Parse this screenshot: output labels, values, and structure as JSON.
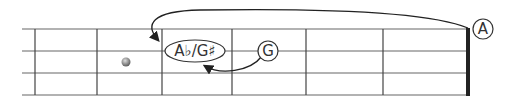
{
  "diagram": {
    "type": "guitar-fretboard",
    "strings": 4,
    "frets": [
      "fret-1",
      "fret-2",
      "fret-3",
      "fret-4",
      "fret-5",
      "fret-6"
    ],
    "inlay_marker": {
      "fret_space": 2,
      "string": "between 2 and 3"
    },
    "notes": {
      "target": "A♭/G♯",
      "g_note": "G",
      "open_a": "A"
    },
    "arrows": [
      {
        "from": "A",
        "to": "A♭/G♯",
        "direction": "curved over fretboard"
      },
      {
        "from": "G",
        "to": "A♭/G♯",
        "direction": "curved under"
      }
    ],
    "colors": {
      "line": "#555555",
      "nut": "#222222",
      "marker": "#888888"
    }
  }
}
